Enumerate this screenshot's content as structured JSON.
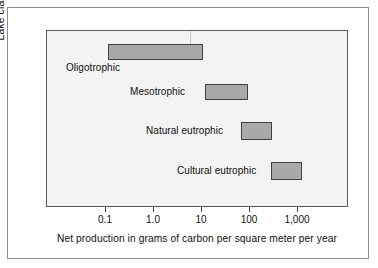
{
  "figure": {
    "background_color": "#ffffff",
    "plot_background_color": "#f3f3f3",
    "bar_fill_color": "#a9a9a9",
    "bar_border_color": "#404040",
    "frame_color": "#5a5a5a"
  },
  "chart_data": {
    "type": "bar",
    "orientation": "horizontal-range",
    "title": "",
    "xlabel": "Net production in grams of carbon per square meter per year",
    "ylabel": "Lake classification",
    "xscale": "log",
    "xlim": [
      0.02,
      5000
    ],
    "grid": false,
    "legend": null,
    "xticks": [
      {
        "value": 0.1,
        "label": "0.1"
      },
      {
        "value": 1.0,
        "label": "1.0"
      },
      {
        "value": 10,
        "label": "10"
      },
      {
        "value": 100,
        "label": "100"
      },
      {
        "value": 1000,
        "label": "1,000"
      }
    ],
    "categories": [
      "Oligotrophic",
      "Mesotrophic",
      "Natural eutrophic",
      "Cultural eutrophic"
    ],
    "bars": [
      {
        "category": "Oligotrophic",
        "low": 0.12,
        "high": 13,
        "label_position": "below-left",
        "px": {
          "left": 108,
          "right": 203,
          "top": 44,
          "bottom": 60
        },
        "label_px": {
          "left": 66,
          "top": 62
        }
      },
      {
        "category": "Mesotrophic",
        "low": 15,
        "high": 110,
        "label_position": "left",
        "px": {
          "left": 205,
          "right": 248,
          "top": 84,
          "bottom": 100
        },
        "label_px": {
          "left": 130,
          "top": 86
        }
      },
      {
        "category": "Natural eutrophic",
        "low": 90,
        "high": 330,
        "label_position": "left",
        "px": {
          "left": 241,
          "right": 272,
          "top": 122,
          "bottom": 140
        },
        "label_px": {
          "left": 146,
          "top": 125
        }
      },
      {
        "category": "Cultural eutrophic",
        "low": 320,
        "high": 1100,
        "label_position": "left",
        "px": {
          "left": 271,
          "right": 302,
          "top": 162,
          "bottom": 180
        },
        "label_px": {
          "left": 177,
          "top": 165
        }
      }
    ]
  },
  "axes": {
    "x_title": "Net production in grams of carbon per square meter per year",
    "y_title": "Lake classification"
  }
}
